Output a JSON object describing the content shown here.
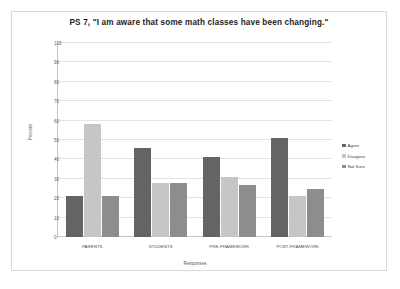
{
  "chart_data": {
    "type": "bar",
    "title": "PS 7, \"I am aware that some math classes have been changing.\"",
    "xlabel": "Responses",
    "ylabel": "Percent",
    "ylim": [
      0,
      100
    ],
    "yticks": [
      0,
      10,
      20,
      30,
      40,
      50,
      60,
      70,
      80,
      90,
      100
    ],
    "grid": true,
    "legend_position": "right",
    "categories": [
      "PARENTS",
      "STUDENTS",
      "PRE-FRAMEWORK",
      "POST-FRAMEWORK"
    ],
    "series": [
      {
        "name": "Agree",
        "color": "#646464",
        "values": [
          21,
          46,
          41,
          51
        ]
      },
      {
        "name": "Disagree",
        "color": "#c6c6c6",
        "values": [
          58,
          28,
          31,
          21
        ]
      },
      {
        "name": "Not Sure",
        "color": "#8d8d8d",
        "values": [
          21,
          28,
          27,
          25
        ]
      }
    ]
  },
  "ytick_labels": {
    "t0": "0",
    "t10": "10",
    "t20": "20",
    "t30": "30",
    "t40": "40",
    "t50": "50",
    "t60": "60",
    "t70": "70",
    "t80": "80",
    "t90": "90",
    "t100": "100"
  }
}
